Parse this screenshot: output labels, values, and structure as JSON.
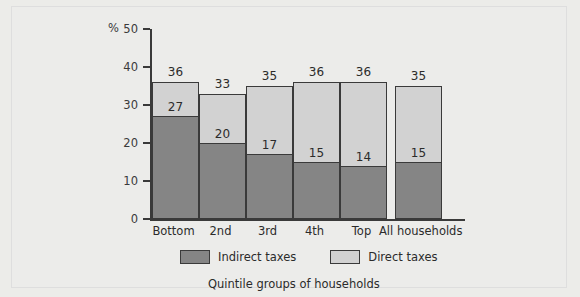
{
  "chart_data": {
    "type": "bar",
    "subtype": "stacked-bar",
    "title": "",
    "xlabel": "Quintile groups of households",
    "ylabel": "%",
    "ylim": [
      0,
      50
    ],
    "yticks": [
      0,
      10,
      20,
      30,
      40,
      50
    ],
    "grid": false,
    "legend_position": "bottom",
    "categories": [
      "Bottom",
      "2nd",
      "3rd",
      "4th",
      "Top",
      "All households"
    ],
    "series": [
      {
        "name": "Indirect taxes",
        "color": "#858585",
        "values": [
          27,
          20,
          17,
          15,
          14,
          15
        ]
      },
      {
        "name": "Direct taxes",
        "color": "#d2d2d2",
        "values": [
          9,
          13,
          18,
          21,
          22,
          20
        ]
      }
    ],
    "totals": [
      36,
      33,
      35,
      36,
      36,
      35
    ],
    "data_labels": {
      "totals_shown": true,
      "indirect_shown": true
    }
  },
  "axis": {
    "percent_symbol": "%",
    "ticks": [
      "50",
      "40",
      "30",
      "20",
      "10",
      "0"
    ]
  },
  "legend": {
    "items": [
      {
        "label": "Indirect taxes",
        "key": "indirect"
      },
      {
        "label": "Direct taxes",
        "key": "direct"
      }
    ]
  },
  "caption": "Quintile groups of households"
}
